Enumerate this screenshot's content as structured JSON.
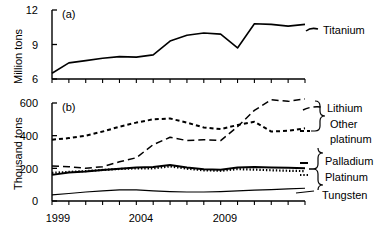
{
  "chart_data": [
    {
      "type": "line",
      "panel_tag": "(a)",
      "title": "",
      "xlabel": "",
      "ylabel": "Million tons",
      "xlim": [
        1999,
        2014
      ],
      "ylim": [
        6,
        12
      ],
      "yticks": [
        6,
        9,
        12
      ],
      "ytick_labels": [
        "6",
        "9",
        "12"
      ],
      "xticks": [
        1999,
        2000,
        2001,
        2002,
        2003,
        2004,
        2005,
        2006,
        2007,
        2008,
        2009,
        2010,
        2011,
        2012,
        2013,
        2014
      ],
      "xtick_labels": [
        "1999",
        "",
        "",
        "",
        "",
        "2004",
        "",
        "",
        "",
        "",
        "2009",
        "",
        "",
        "",
        "",
        ""
      ],
      "grid": false,
      "legend_position": "right",
      "x": [
        1999,
        2000,
        2001,
        2002,
        2003,
        2004,
        2005,
        2006,
        2007,
        2008,
        2009,
        2010,
        2011,
        2012,
        2013,
        2014
      ],
      "series": [
        {
          "name": "Titanium",
          "style": "solid",
          "values": [
            6.5,
            7.4,
            7.6,
            7.8,
            7.95,
            7.9,
            8.1,
            9.3,
            9.8,
            10.0,
            9.9,
            8.7,
            10.8,
            10.75,
            10.6,
            10.75
          ]
        }
      ]
    },
    {
      "type": "line",
      "panel_tag": "(b)",
      "title": "",
      "xlabel": "",
      "ylabel": "Thousand tons",
      "xlim": [
        1999,
        2014
      ],
      "ylim": [
        0,
        600
      ],
      "yticks": [
        0,
        200,
        400,
        600
      ],
      "ytick_labels": [
        "0",
        "200",
        "400",
        "600"
      ],
      "xticks": [
        1999,
        2000,
        2001,
        2002,
        2003,
        2004,
        2005,
        2006,
        2007,
        2008,
        2009,
        2010,
        2011,
        2012,
        2013,
        2014
      ],
      "xtick_labels": [
        "1999",
        "",
        "",
        "",
        "",
        "2004",
        "",
        "",
        "",
        "",
        "2009",
        "",
        "",
        "",
        "",
        ""
      ],
      "grid": false,
      "legend_position": "right",
      "x": [
        1999,
        2000,
        2001,
        2002,
        2003,
        2004,
        2005,
        2006,
        2007,
        2008,
        2009,
        2010,
        2011,
        2012,
        2013,
        2014
      ],
      "series": [
        {
          "name": "Lithium",
          "style": "long-dashed",
          "values": [
            215,
            210,
            200,
            210,
            240,
            265,
            345,
            390,
            370,
            375,
            370,
            455,
            555,
            620,
            610,
            625
          ]
        },
        {
          "name": "Other platinum",
          "style": "short-dashed",
          "values": [
            375,
            385,
            400,
            425,
            455,
            480,
            500,
            505,
            480,
            450,
            440,
            465,
            485,
            425,
            430,
            445
          ]
        },
        {
          "name": "Palladium",
          "style": "solid-thick",
          "values": [
            160,
            175,
            180,
            190,
            198,
            205,
            208,
            220,
            205,
            195,
            192,
            205,
            208,
            205,
            203,
            200
          ]
        },
        {
          "name": "Platinum",
          "style": "dotted",
          "values": [
            172,
            178,
            183,
            190,
            196,
            200,
            200,
            212,
            198,
            188,
            185,
            195,
            192,
            188,
            185,
            183
          ]
        },
        {
          "name": "Tungsten",
          "style": "solid-thin",
          "values": [
            38,
            46,
            55,
            62,
            68,
            68,
            62,
            58,
            55,
            55,
            58,
            62,
            66,
            70,
            74,
            78
          ]
        }
      ]
    }
  ],
  "axes": {
    "panel_a": {
      "tag": "(a)",
      "ylabel": "Million tons",
      "ytick_0": "12",
      "ytick_1": "9",
      "ytick_2": "6"
    },
    "panel_b": {
      "tag": "(b)",
      "ylabel": "Thousand tons",
      "ytick_0": "600",
      "ytick_1": "400",
      "ytick_2": "200",
      "ytick_3": "0"
    },
    "xtick_labels": {
      "first": "1999",
      "second": "2004",
      "third": "2009"
    }
  },
  "labels": {
    "titanium": "Titanium",
    "lithium": "Lithium",
    "other": "Other",
    "platinum_word": "platinum",
    "palladium": "Palladium",
    "platinum": "Platinum",
    "tungsten": "Tungsten"
  },
  "colors": {
    "line": "#000000",
    "axis": "#000000",
    "background": "#ffffff"
  }
}
